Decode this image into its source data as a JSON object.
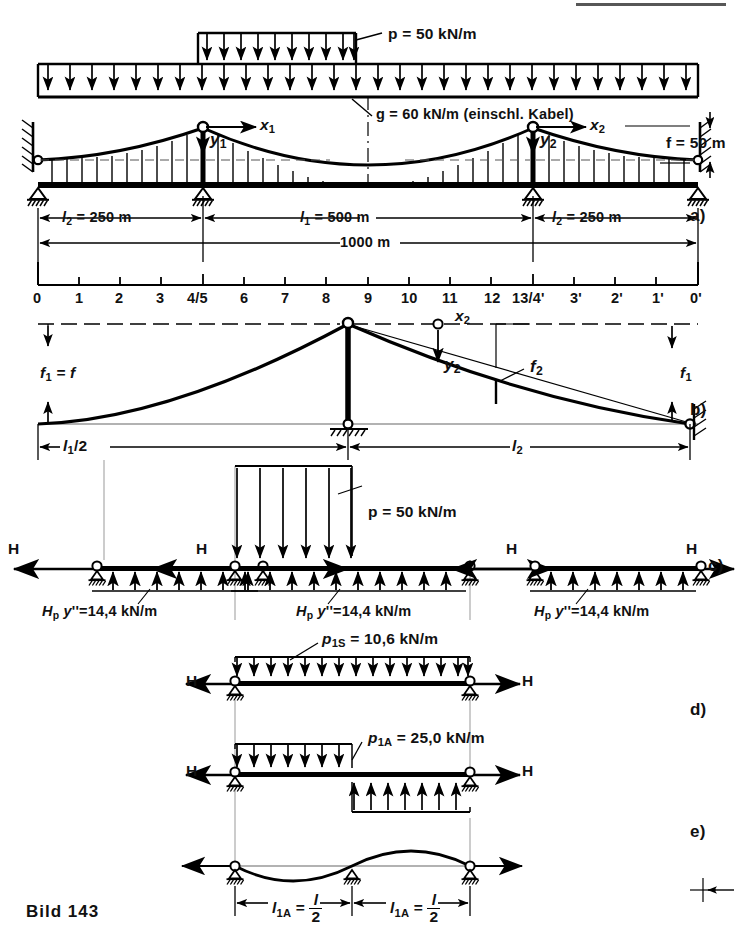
{
  "figure": {
    "caption": "Bild 143",
    "panel_labels": [
      "a)",
      "b)",
      "c)",
      "d)",
      "e)"
    ]
  },
  "loads": {
    "p_label": "p = 50 kN/m",
    "p_value": 50,
    "g_label": "g = 60 kN/m (einschl. Kabel)",
    "g_value": 60,
    "p_unit": "kN/m"
  },
  "panel_a": {
    "label": "a)",
    "x1": "x",
    "x1_sub": "1",
    "x2": "x",
    "x2_sub": "2",
    "y1": "y",
    "y1_sub": "1",
    "y2": "y",
    "y2_sub": "2",
    "sag": "f = 50 m",
    "sag_value": 50,
    "dim_left": "l",
    "dim_left_sub": "2",
    "dim_left_val": "= 250 m",
    "dim_mid": "l",
    "dim_mid_sub": "1",
    "dim_mid_val": "= 500 m",
    "dim_right": "l",
    "dim_right_sub": "2",
    "dim_right_val": "= 250 m",
    "dim_total": "1000 m",
    "span_side_m": 250,
    "span_main_m": 500,
    "span_total_m": 1000
  },
  "station_scale": {
    "ticks": [
      "0",
      "1",
      "2",
      "3",
      "4/5",
      "6",
      "7",
      "8",
      "9",
      "10",
      "11",
      "12",
      "13/4'",
      "3'",
      "2'",
      "1'",
      "0'"
    ]
  },
  "panel_b": {
    "label": "b)",
    "f1_eq": "f",
    "f1_eq_sub": "1",
    "f1_eq_val": "= f",
    "f1": "f",
    "f1_sub": "1",
    "f2": "f",
    "f2_sub": "2",
    "y2": "y",
    "y2_sub": "2",
    "x2": "x",
    "x2_sub": "2",
    "dim_half": "l",
    "dim_half_sub": "1",
    "dim_half_val": "/2",
    "dim_l2": "l",
    "dim_l2_sub": "2"
  },
  "panel_c": {
    "label": "c)",
    "H": "H",
    "p_label": "p = 50 kN/m",
    "reaction_H": "H",
    "reaction_sub": "p",
    "reaction_y": "y",
    "reaction_prime": "''",
    "reaction_val": "=14,4 kN/m",
    "reaction_value": 14.4,
    "segments": 3
  },
  "panel_d": {
    "label": "d)",
    "H": "H",
    "sym_p": "p",
    "sym_sub": "1S",
    "sym_val": "= 10,6 kN/m",
    "sym_value": 10.6,
    "anti_p": "p",
    "anti_sub": "1A",
    "anti_val": "= 25,0 kN/m",
    "anti_value": 25.0
  },
  "panel_e": {
    "label": "e)",
    "dim_left": "l",
    "dim_left_sub": "1A",
    "dim_eq": "=",
    "dim_num": "l",
    "dim_num_sub": "1",
    "dim_den": "2",
    "dim_right": "l",
    "dim_right_sub": "1A"
  },
  "colors": {
    "ink": "#000000",
    "paper": "#ffffff",
    "thin": "#111111"
  }
}
